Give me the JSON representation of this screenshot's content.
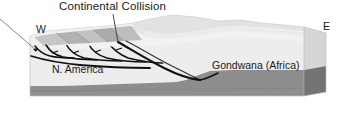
{
  "figure": {
    "type": "geologic-block-diagram",
    "title": "Continental Collision",
    "compass": {
      "west": "W",
      "east": "E"
    },
    "regions": [
      {
        "id": "n-america",
        "label": "N. America"
      },
      {
        "id": "gondwana",
        "label": "Gondwana (Africa)"
      }
    ],
    "colors": {
      "background": "#ffffff",
      "text": "#1a1a1a",
      "upper_crust_top": "#f2f2f2",
      "upper_crust_front": "#e9e9e9",
      "upper_crust_side": "#d4d4d4",
      "lower_crust_front": "#8e8e8e",
      "lower_crust_side": "#717171",
      "thrust_sheet_a": "#c9c9c9",
      "thrust_sheet_b": "#b5b5b5",
      "thrust_sheet_c": "#a6a6a6",
      "highland_shade": "#e0e0e0",
      "fault_line": "#111111",
      "leader_line": "#555555"
    },
    "features": {
      "thrust_stack": "imbricate-thrust-sheets",
      "suture": "main-suture-fault",
      "decollement": "basal-detachment",
      "topography": "orogenic-highland"
    }
  }
}
